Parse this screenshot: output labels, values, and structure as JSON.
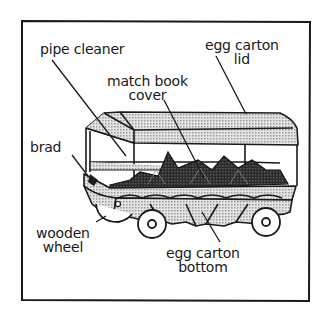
{
  "diagram": {
    "colors": {
      "ink": "#1a1a1a",
      "shade": "#c9c9c9",
      "cargo": "#3a3a3a",
      "paper": "#ffffff"
    },
    "labels": {
      "pipe_cleaner": {
        "lines": [
          "pipe cleaner"
        ]
      },
      "egg_carton_lid": {
        "lines": [
          "egg carton",
          "lid"
        ]
      },
      "match_book_cover": {
        "lines": [
          "match book",
          "cover"
        ]
      },
      "brad": {
        "lines": [
          "brad"
        ]
      },
      "wooden_wheel": {
        "lines": [
          "wooden",
          "wheel"
        ]
      },
      "egg_carton_bottom": {
        "lines": [
          "egg carton",
          "bottom"
        ]
      }
    }
  }
}
